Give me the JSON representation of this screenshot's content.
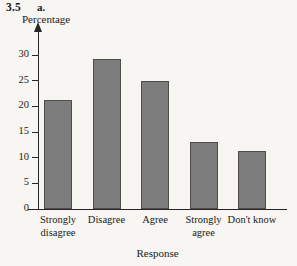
{
  "figure": {
    "number": "3.5",
    "part": "a."
  },
  "chart_data": {
    "type": "bar",
    "title": "3.5 a.",
    "xlabel": "Response",
    "ylabel": "Percentage",
    "categories": [
      "Strongly disagree",
      "Disagree",
      "Agree",
      "Strongly agree",
      "Don't know"
    ],
    "values": [
      21.3,
      29.3,
      25.0,
      13.0,
      11.3
    ],
    "ylim": [
      0,
      32
    ],
    "yticks": [
      0,
      5,
      10,
      15,
      20,
      25,
      30
    ],
    "ytick_labels": [
      "0",
      "5",
      "10",
      "15",
      "20",
      "25",
      "30"
    ],
    "grid": false,
    "legend": null,
    "bar_color": "#7d7d7d",
    "bar_edge_color": "#4d4d4d",
    "axis_color": "#262626",
    "background_color": "#f7f6f2"
  },
  "category_lines": [
    [
      "Strongly",
      "disagree"
    ],
    [
      "Disagree",
      ""
    ],
    [
      "Agree",
      ""
    ],
    [
      "Strongly",
      "agree"
    ],
    [
      "Don't know",
      ""
    ]
  ]
}
